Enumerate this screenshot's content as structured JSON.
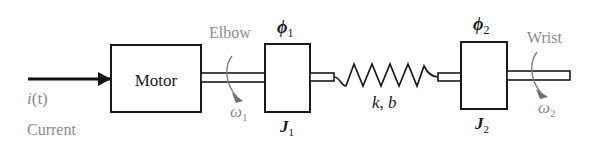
{
  "diagram": {
    "type": "mechanical schematic",
    "colors": {
      "stroke": "#1a1a1a",
      "annotation": "#8a8a8a",
      "background": "#ffffff"
    },
    "input": {
      "signal": "i(t)",
      "signal_italic_var": "i",
      "signal_arg": "(t)",
      "label": "Current"
    },
    "motor": {
      "label": "Motor"
    },
    "elbow": {
      "label": "Elbow",
      "angular_velocity": "ω",
      "angular_velocity_sub": "1"
    },
    "inertia1": {
      "angle": "ϕ",
      "angle_sub": "1",
      "inertia": "J",
      "inertia_sub": "1"
    },
    "coupling": {
      "stiffness": "k",
      "damping": "b",
      "separator": ", "
    },
    "inertia2": {
      "angle": "ϕ",
      "angle_sub": "2",
      "inertia": "J",
      "inertia_sub": "2"
    },
    "wrist": {
      "label": "Wrist",
      "angular_velocity": "ω",
      "angular_velocity_sub": "2"
    }
  }
}
